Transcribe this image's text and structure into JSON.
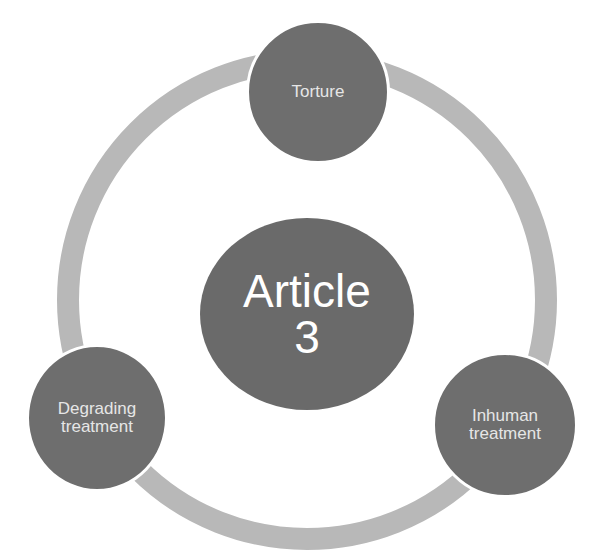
{
  "diagram": {
    "type": "cycle",
    "colors": {
      "background": "#ffffff",
      "ring": "#b8b8b8",
      "node_fill": "#6e6e6e",
      "center_fill": "#6a6a6a",
      "node_text": "#e6e6e6",
      "center_text": "#ffffff"
    },
    "center": {
      "label": "Article\n3"
    },
    "nodes": [
      {
        "label": "Torture"
      },
      {
        "label": "Inhuman\ntreatment"
      },
      {
        "label": "Degrading\ntreatment"
      }
    ]
  }
}
